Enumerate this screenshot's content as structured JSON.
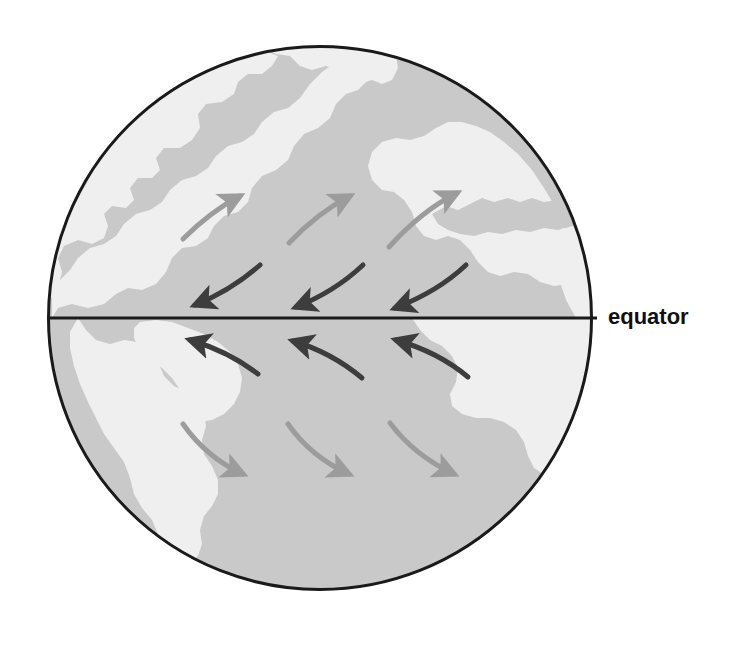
{
  "figure": {
    "kind": "globe-diagram",
    "background_color": "#ffffff"
  },
  "globe": {
    "center_x": 320,
    "center_y": 318,
    "radius": 273,
    "outline_color": "#1a1a1a",
    "outline_width": 3,
    "ocean_color": "#c9c9c9",
    "land_color": "#efefef"
  },
  "equator": {
    "label": "equator",
    "label_x": 608,
    "label_y": 318,
    "label_color": "#111111",
    "line_color": "#1a1a1a",
    "line_width": 3,
    "line_y": 318,
    "line_x_start": 47,
    "line_x_end": 597
  },
  "landmasses": [
    {
      "name": "north-america",
      "hemisphere": "north",
      "side": "west"
    },
    {
      "name": "south-america",
      "hemisphere": "south",
      "side": "west"
    },
    {
      "name": "europe",
      "hemisphere": "north",
      "side": "east"
    },
    {
      "name": "africa",
      "hemisphere": "both",
      "side": "east"
    }
  ],
  "arrows": {
    "light_color": "#9c9c9c",
    "dark_color": "#3d3d3d",
    "stroke_width": 5,
    "groups": [
      {
        "name": "northern-westerlies",
        "style": "light",
        "hemisphere": "north",
        "direction": "northeast",
        "count": 3
      },
      {
        "name": "northeast-trade-winds",
        "style": "dark",
        "hemisphere": "north",
        "direction": "southwest",
        "count": 3
      },
      {
        "name": "southeast-trade-winds",
        "style": "dark",
        "hemisphere": "south",
        "direction": "northwest",
        "count": 3
      },
      {
        "name": "southern-westerlies",
        "style": "light",
        "hemisphere": "south",
        "direction": "southeast",
        "count": 3
      }
    ]
  }
}
